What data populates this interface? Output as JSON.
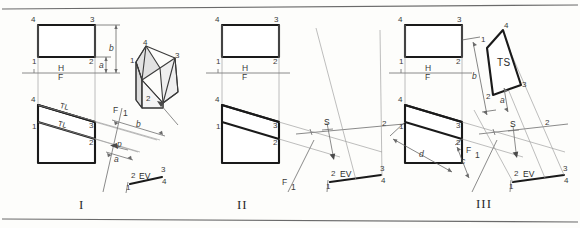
{
  "plate": {
    "title": "Successive auxiliary views of oblique plane 1-2-3-4",
    "border_color": "#6a6a6a",
    "object_color": "#1a1a1a",
    "projector_color": "#9a9a9a"
  },
  "panels": [
    {
      "numeral": "I",
      "caption_name": "step-1",
      "top_view": {
        "name": "top-view-rectangle",
        "vertices": [
          "4",
          "3",
          "1",
          "2"
        ]
      },
      "front_view": {
        "name": "front-view-plane",
        "vertices": [
          "4",
          "3",
          "1",
          "2"
        ],
        "true_length_labels": [
          "TL",
          "TL"
        ]
      },
      "fold_line": {
        "upper": "H",
        "lower": "F"
      },
      "aux_fold_line": {
        "upper": "F",
        "lower": "1"
      },
      "aux_view": {
        "name": "auxiliary-edge-view",
        "edge_view_label": "EV",
        "vertices": [
          "2",
          "3",
          "4",
          "1"
        ],
        "dimensions": [
          "b",
          "a",
          "p"
        ]
      },
      "dimensions": [
        "b",
        "a"
      ],
      "pictorial": {
        "name": "pictorial-solid",
        "vertices": [
          "4",
          "1",
          "3",
          "2"
        ],
        "has_pointer_arrow": true
      }
    },
    {
      "numeral": "II",
      "caption_name": "step-2",
      "top_view": {
        "name": "top-view-rectangle",
        "vertices": [
          "4",
          "3",
          "1",
          "2"
        ]
      },
      "front_view": {
        "name": "front-view-plane",
        "vertices": [
          "4",
          "3",
          "1",
          "2"
        ]
      },
      "fold_line": {
        "upper": "H",
        "lower": "F"
      },
      "aux_fold_line": {
        "upper": "F",
        "lower": "1"
      },
      "aux_view": {
        "name": "auxiliary-edge-view",
        "edge_view_label": "EV",
        "vertices": [
          "2",
          "3",
          "4",
          "1"
        ]
      },
      "sight": {
        "label": "S",
        "name": "sight-direction-arrow"
      },
      "second_fold_line": {
        "label": "2"
      }
    },
    {
      "numeral": "III",
      "caption_name": "step-3",
      "top_view": {
        "name": "top-view-rectangle",
        "vertices": [
          "4",
          "3",
          "1",
          "2"
        ]
      },
      "front_view": {
        "name": "front-view-plane",
        "vertices": [
          "4",
          "3",
          "1",
          "2"
        ],
        "dimensions": [
          "d",
          "c"
        ]
      },
      "fold_line": {
        "upper": "H",
        "lower": "F"
      },
      "aux_fold_line": {
        "upper": "F",
        "lower": "1"
      },
      "aux_view": {
        "name": "auxiliary-edge-view",
        "edge_view_label": "EV",
        "vertices": [
          "2",
          "3",
          "4",
          "1"
        ]
      },
      "sight": {
        "label": "S",
        "name": "sight-direction-arrow"
      },
      "second_fold_line": {
        "label": "2"
      },
      "true_size_view": {
        "name": "true-size-view",
        "label": "TS",
        "vertices": [
          "4",
          "3",
          "2",
          "1"
        ],
        "dimensions": [
          "b",
          "a"
        ]
      }
    }
  ],
  "glossary": {
    "EV": "edge view",
    "TS": "true size",
    "TL": "true length",
    "S": "line of sight",
    "H": "horizontal plane",
    "F": "frontal plane"
  }
}
